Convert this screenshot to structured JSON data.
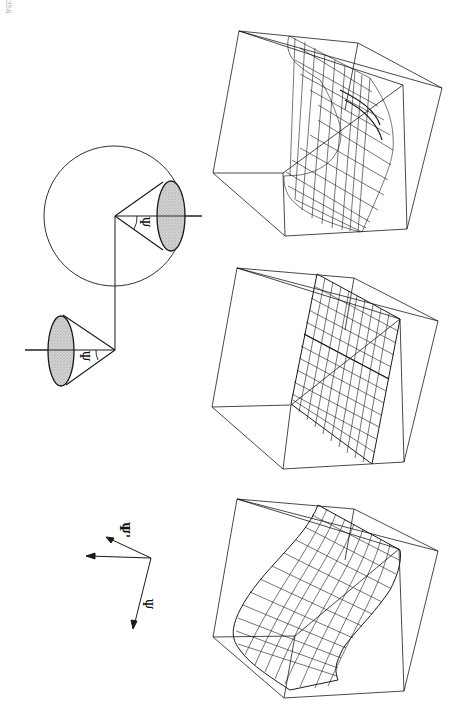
{
  "page": {
    "number": "358",
    "orientation": "rotated-90"
  },
  "figure": {
    "cone_diagram": {
      "upper_cone_label": "Ψ",
      "lower_cone_label": "Ψ"
    },
    "axes": {
      "label_primary": "Ψ",
      "label_secondary": "Ψ'"
    },
    "panels": [
      {
        "name": "distorted-surface",
        "description": "wireframe surface with strong folds inside cube"
      },
      {
        "name": "planar-surface",
        "description": "nearly planar wireframe sheet inside cube"
      },
      {
        "name": "curved-surface",
        "description": "smoothly curved wireframe sheet inside cube"
      }
    ]
  },
  "colors": {
    "ink": "#1a1a1a",
    "shade": "#bdbdbd",
    "background": "#ffffff"
  }
}
